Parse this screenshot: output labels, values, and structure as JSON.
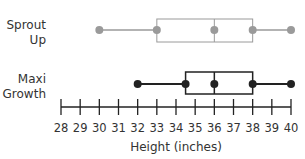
{
  "chart_data": {
    "type": "boxplot",
    "title": "",
    "xlabel": "Height (inches)",
    "ylabel": "",
    "xlim": [
      28,
      40
    ],
    "ticks": [
      28,
      29,
      30,
      31,
      32,
      33,
      34,
      35,
      36,
      37,
      38,
      39,
      40
    ],
    "tick_labels": [
      "28",
      "29",
      "30",
      "31",
      "32",
      "33",
      "34",
      "35",
      "36",
      "37",
      "38",
      "39",
      "40"
    ],
    "grid": false,
    "legend": null,
    "series": [
      {
        "name": "Sprout Up",
        "label_lines": [
          "Sprout",
          "Up"
        ],
        "min": 30,
        "q1": 33,
        "median": 36,
        "q3": 38,
        "max": 40,
        "color": "#9a9a9a"
      },
      {
        "name": "Maxi Growth",
        "label_lines": [
          "Maxi",
          "Growth"
        ],
        "min": 32,
        "q1": 34.5,
        "median": 36,
        "q3": 38,
        "max": 40,
        "color": "#222222"
      }
    ]
  }
}
